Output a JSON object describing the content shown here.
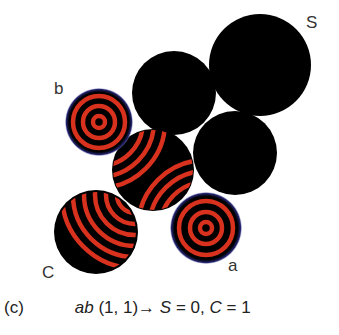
{
  "figure": {
    "panel_label": "(c)",
    "caption": {
      "inputs_var": "ab",
      "inputs_value": "(1, 1)",
      "arrow": "→",
      "sum_var": "S",
      "sum_eq": "= 0,",
      "carry_var": "C",
      "carry_eq": "= 1"
    },
    "labels": {
      "input_a": "a",
      "input_b": "b",
      "output_sum": "S",
      "output_carry": "C"
    },
    "colors": {
      "cell_fill": "#000000",
      "wave_red": "#d8321e",
      "rim_blue": "#1a1a5a",
      "background": "#ffffff"
    },
    "cells": [
      {
        "id": "S",
        "cx": 260,
        "cy": 65,
        "r": 51,
        "state": "quiescent"
      },
      {
        "id": "top-middle",
        "cx": 174,
        "cy": 93,
        "r": 42,
        "state": "quiescent"
      },
      {
        "id": "right-middle",
        "cx": 235,
        "cy": 153,
        "r": 42,
        "state": "quiescent"
      },
      {
        "id": "center",
        "cx": 153,
        "cy": 170,
        "r": 41,
        "state": "colliding-waves"
      },
      {
        "id": "b",
        "cx": 99,
        "cy": 122,
        "r": 33,
        "state": "target-pattern"
      },
      {
        "id": "a",
        "cx": 206,
        "cy": 228,
        "r": 35,
        "state": "target-pattern"
      },
      {
        "id": "C",
        "cx": 96,
        "cy": 232,
        "r": 42,
        "state": "waves-arriving"
      }
    ]
  }
}
